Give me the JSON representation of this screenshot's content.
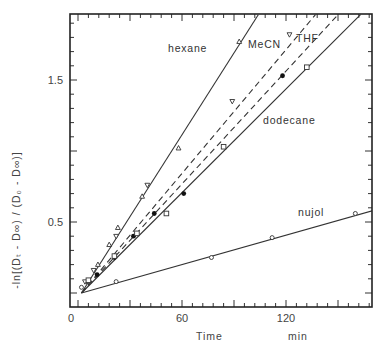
{
  "chart_data": {
    "type": "line",
    "title": "",
    "xlabel": "Time",
    "xunit": "min",
    "ylabel": "-ln[(D_t - D_∞)/(D_0 - D_∞)]",
    "xlim": [
      -5,
      170
    ],
    "ylim": [
      -0.1,
      1.96
    ],
    "xticks": [
      0,
      60,
      120
    ],
    "xtick_labels": [
      "0",
      "60",
      "120"
    ],
    "yticks": [
      0.5,
      1.5
    ],
    "ytick_labels": [
      "0.5",
      "1.5"
    ],
    "grid": false,
    "legend": "inline labels",
    "series": [
      {
        "name": "hexane",
        "style": "solid",
        "marker": "triangle-up",
        "x": [
          6,
          11.5,
          18,
          23,
          37,
          58,
          93
        ],
        "y": [
          0.08,
          0.2,
          0.34,
          0.46,
          0.68,
          1.02,
          1.77
        ],
        "fit": {
          "x": [
            2,
            104
          ],
          "y": [
            0.0,
            1.96
          ]
        }
      },
      {
        "name": "MeCN",
        "style": "dashed",
        "marker": "triangle-down",
        "x": [
          4,
          9,
          22,
          40,
          89,
          122
        ],
        "y": [
          0.08,
          0.16,
          0.4,
          0.76,
          1.35,
          1.82
        ],
        "fit": {
          "x": [
            2,
            137
          ],
          "y": [
            0.0,
            1.96
          ]
        }
      },
      {
        "name": "THF",
        "style": "dashed",
        "marker": "filled-circle",
        "x": [
          11,
          21,
          32,
          44,
          61,
          118
        ],
        "y": [
          0.13,
          0.25,
          0.4,
          0.56,
          0.7,
          1.53
        ],
        "fit": {
          "x": [
            2,
            150
          ],
          "y": [
            0.0,
            1.96
          ]
        }
      },
      {
        "name": "dodecane",
        "style": "solid",
        "marker": "open-square",
        "x": [
          6,
          21,
          34,
          51,
          84,
          132
        ],
        "y": [
          0.09,
          0.26,
          0.42,
          0.56,
          1.03,
          1.59
        ],
        "fit": {
          "x": [
            2,
            163
          ],
          "y": [
            0.0,
            1.96
          ]
        }
      },
      {
        "name": "nujol",
        "style": "solid",
        "marker": "open-circle",
        "x": [
          2,
          22,
          77,
          112,
          160
        ],
        "y": [
          0.04,
          0.08,
          0.25,
          0.39,
          0.56
        ],
        "fit": {
          "x": [
            2,
            170
          ],
          "y": [
            0.0,
            0.58
          ]
        }
      }
    ],
    "label_positions": {
      "hexane": [
        168,
        52
      ],
      "MeCN": [
        248,
        48
      ],
      "THF": [
        296,
        42
      ],
      "dodecane": [
        263,
        124
      ],
      "nujol": [
        298,
        216
      ]
    }
  },
  "text": {
    "y_axis_title": "-ln[(Dₜ - D∞) / (D₀ - D∞)]",
    "x_axis_title": "Time",
    "x_axis_unit": "min",
    "caption": "Fig. 7. Subsequent plots of the decay ..."
  }
}
